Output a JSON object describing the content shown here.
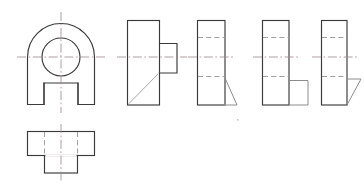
{
  "document": {
    "title": "Orthographic Projection Views",
    "description": "Engineering drawing with six orthographic views of a bracket part",
    "background_color": "#ffffff"
  },
  "line_styles": {
    "visible_edge": {
      "name": "solid-outline",
      "color": "#3a3a3a",
      "width": 1.15
    },
    "visible_edge_light": {
      "name": "solid-outline-light",
      "color": "#8c8c8c",
      "width": 1.0
    },
    "hidden_edge": {
      "name": "hidden-dashed",
      "color": "#9a9a9a",
      "width": 0.95,
      "dash": "5 3.2"
    },
    "center_mark": {
      "name": "center-dash-dot",
      "color": "#9c8e8e",
      "width": 0.85,
      "dash": "9 2.6 1.6 2.6"
    },
    "section_hatch": {
      "name": "diagonal-cut",
      "color": "#a8a8a8",
      "width": 1.0
    }
  },
  "views": [
    {
      "id": "view-front",
      "label": "front-view",
      "shape": "arched-plate-with-bore-and-notch",
      "bounds": {
        "x": 27,
        "y": 13,
        "width": 67,
        "height": 92
      },
      "features": {
        "arch_radius": 33,
        "bore_center": {
          "x": 61,
          "y": 57
        },
        "bore_radius": 19,
        "notch": {
          "x": 44,
          "y": 83,
          "width": 34,
          "height": 22
        }
      }
    },
    {
      "id": "view-bottom",
      "label": "bottom-view",
      "shape": "inverted-tee-plate",
      "bounds": {
        "x": 27,
        "y": 131,
        "width": 67,
        "height": 24
      },
      "features": {
        "tongue": {
          "x": 44,
          "y": 155,
          "width": 34,
          "height": 18
        }
      }
    },
    {
      "id": "view-right-1",
      "label": "side-view-with-boss",
      "shape": "rectangle-with-right-boss-and-cut",
      "bounds": {
        "x": 127,
        "y": 20,
        "width": 32,
        "height": 85
      },
      "features": {
        "boss": {
          "x": 159,
          "y": 43,
          "width": 18,
          "height": 30
        },
        "cut_corner": "bottom-left-diagonal"
      }
    },
    {
      "id": "view-right-2",
      "label": "side-view-with-triangle-cut",
      "shape": "rectangle-with-bottom-right-triangle",
      "bounds": {
        "x": 197,
        "y": 20,
        "width": 28,
        "height": 85
      },
      "features": {
        "triangle": {
          "apex_x": 225,
          "apex_y": 78,
          "base_x": 237,
          "base_y": 105
        }
      }
    },
    {
      "id": "view-right-3",
      "label": "side-view-with-corner-block",
      "shape": "rectangle-with-bottom-right-block",
      "bounds": {
        "x": 262,
        "y": 20,
        "width": 27,
        "height": 85
      },
      "features": {
        "block": {
          "x": 289,
          "y": 80,
          "width": 19,
          "height": 25
        }
      }
    },
    {
      "id": "view-right-4",
      "label": "side-view-with-angled-flange",
      "shape": "rectangle-with-bottom-right-parallelogram",
      "bounds": {
        "x": 321,
        "y": 20,
        "width": 26,
        "height": 85
      },
      "features": {
        "flange": {
          "top_x": 347,
          "top_y": 79,
          "tip_x": 360,
          "tip_y": 79,
          "bottom_x": 347,
          "bottom_y": 105
        }
      }
    }
  ],
  "center_lines": {
    "horizontal_y": 57,
    "vertical_x_front": 61,
    "vertical_x_bottom": 61,
    "extension_overhang": 9
  }
}
